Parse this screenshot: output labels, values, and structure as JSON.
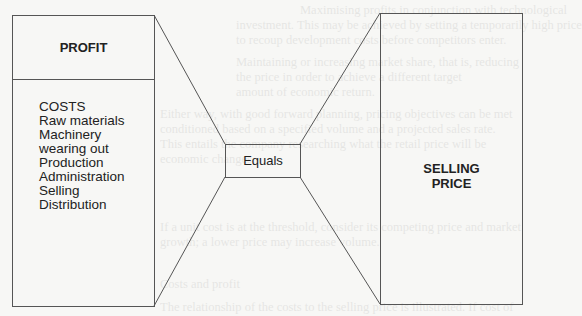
{
  "diagram": {
    "left_box": {
      "header": "PROFIT",
      "costs_title": "COSTS",
      "cost_items": [
        "Raw materials",
        "Machinery",
        "wearing out",
        "Production",
        "Administration",
        "Selling",
        "Distribution"
      ]
    },
    "center_box": {
      "label": "Equals"
    },
    "right_box": {
      "line1": "SELLING",
      "line2": "PRICE"
    },
    "colors": {
      "stroke": "#555555",
      "text": "#222222",
      "background": "#f7f7f5"
    }
  },
  "bleed_through_text": [
    "Maximising profits in conjunction with technological",
    "investment. This may be achieved by setting a temporarily high price",
    "to recoup development costs before competitors enter.",
    "Maintaining or increasing market share, that is, reducing",
    "the price in order to achieve a different target",
    "amount of economic return.",
    "Either way, with good forward planning, pricing objectives can be met",
    "conditioned based on a specified volume and a projected sales rate.",
    "This entails the company researching what the retail price will be",
    "economic changes.",
    "If a unit cost is at the threshold, consider its competing price and market",
    "growth; a lower price may increase volume.",
    "Costs and profit",
    "The relationship of the costs to the selling price is illustrated. If cost of"
  ]
}
